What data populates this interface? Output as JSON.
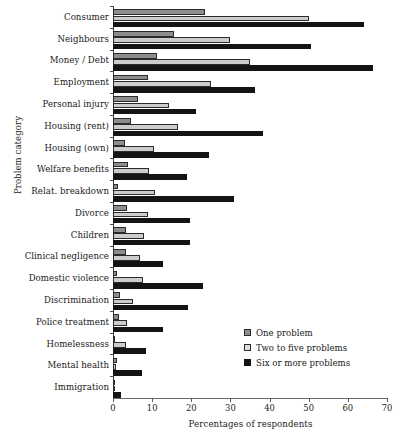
{
  "chart_data": {
    "type": "bar",
    "orientation": "horizontal",
    "title": "",
    "xlabel": "Percentages of respondents",
    "ylabel": "Problem category",
    "xlim": [
      0,
      70
    ],
    "xticks": [
      0,
      10,
      20,
      30,
      40,
      50,
      60,
      70
    ],
    "grid": false,
    "legend_position": "bottom-right",
    "categories": [
      "Consumer",
      "Neighbours",
      "Money / Debt",
      "Employment",
      "Personal injury",
      "Housing (rent)",
      "Housing (own)",
      "Welfare benefits",
      "Relat. breakdown",
      "Divorce",
      "Children",
      "Clinical negligence",
      "Domestic violence",
      "Discrimination",
      "Police treatment",
      "Homelessness",
      "Mental health",
      "Immigration"
    ],
    "series": [
      {
        "name": "One problem",
        "color": "#8d8d8d",
        "values": [
          23.6,
          15.5,
          11.3,
          9.0,
          6.4,
          4.6,
          3.0,
          3.8,
          1.3,
          3.7,
          3.3,
          3.3,
          1.0,
          1.8,
          1.5,
          0.4,
          1.0,
          0.3
        ]
      },
      {
        "name": "Two to five problems",
        "color": "#cccccc",
        "values": [
          50.0,
          30.0,
          35.0,
          25.0,
          14.4,
          16.6,
          10.5,
          9.3,
          10.8,
          9.0,
          8.0,
          6.8,
          7.6,
          5.2,
          3.6,
          3.3,
          0.8,
          0.5
        ]
      },
      {
        "name": "Six or more problems",
        "color": "#141414",
        "values": [
          64.0,
          50.7,
          66.4,
          36.4,
          21.3,
          38.2,
          24.6,
          19.0,
          31.0,
          19.7,
          19.7,
          12.7,
          22.9,
          19.2,
          12.7,
          8.5,
          7.4,
          2.1
        ]
      }
    ]
  }
}
